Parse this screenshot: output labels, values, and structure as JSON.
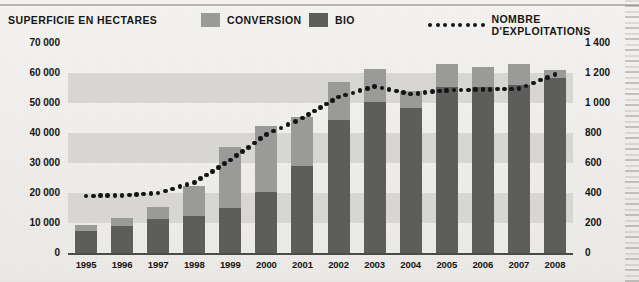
{
  "legend": {
    "series_title": "SUPERFICIE EN HECTARES",
    "conversion_label": "CONVERSION",
    "bio_label": "BIO",
    "line_label": "NOMBRE D'EXPLOITATIONS",
    "conversion_color": "#9a9a98",
    "bio_color": "#5d5d5c",
    "line_color": "#141414"
  },
  "axes": {
    "left_ticks": [
      "70 000",
      "60 000",
      "50 000",
      "40 000",
      "30 000",
      "20 000",
      "10 000",
      "0"
    ],
    "right_ticks": [
      "1 400",
      "1 200",
      "1 000",
      "800",
      "600",
      "400",
      "200",
      "0"
    ],
    "left_label": "SUPERFICIE EN HECTARES",
    "right_label": "NOMBRE D'EXPLOITATIONS"
  },
  "chart_data": {
    "type": "bar",
    "title": "",
    "xlabel": "",
    "ylabel": "SUPERFICIE EN HECTARES",
    "y2label": "NOMBRE D'EXPLOITATIONS",
    "ylim": [
      0,
      70000
    ],
    "y2lim": [
      0,
      1400
    ],
    "grid": "horizontal-bands",
    "legend_position": "top",
    "categories": [
      "1995",
      "1996",
      "1997",
      "1998",
      "1999",
      "2000",
      "2001",
      "2002",
      "2003",
      "2004",
      "2005",
      "2006",
      "2007",
      "2008"
    ],
    "series": [
      {
        "name": "BIO",
        "type": "bar",
        "axis": "left",
        "color": "#5d5d5c",
        "values": [
          7500,
          9000,
          11500,
          12500,
          15000,
          20500,
          29000,
          44500,
          50500,
          48500,
          55500,
          55500,
          56000,
          58500
        ]
      },
      {
        "name": "CONVERSION",
        "type": "bar",
        "axis": "left",
        "color": "#9a9a98",
        "values": [
          2000,
          2800,
          4000,
          10000,
          20500,
          22000,
          16500,
          12500,
          11000,
          5500,
          7500,
          6500,
          7000,
          2500
        ]
      },
      {
        "name": "NOMBRE D'EXPLOITATIONS",
        "type": "line",
        "axis": "right",
        "color": "#141414",
        "style": "dotted",
        "values": [
          380,
          385,
          400,
          470,
          620,
          790,
          900,
          1040,
          1110,
          1060,
          1085,
          1090,
          1095,
          1190
        ]
      }
    ],
    "totals": [
      9500,
      11800,
      15500,
      22500,
      35500,
      42500,
      45500,
      57000,
      61500,
      54000,
      63000,
      62000,
      63000,
      61000
    ]
  }
}
